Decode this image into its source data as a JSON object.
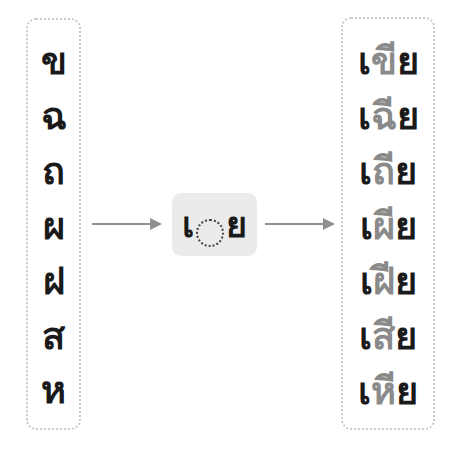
{
  "diagram": {
    "input_consonants": [
      "ข",
      "ฉ",
      "ถ",
      "ผ",
      "ฝ",
      "ส",
      "ห"
    ],
    "pattern": {
      "prefix": "เ",
      "placeholder": "◌",
      "upper_vowel": "ี",
      "suffix": "ย",
      "full": "เ◌ีย"
    },
    "outputs": [
      {
        "pre": "เ",
        "cons": "ขี",
        "post": "ย",
        "full": "เขีย"
      },
      {
        "pre": "เ",
        "cons": "ฉี",
        "post": "ย",
        "full": "เฉีย"
      },
      {
        "pre": "เ",
        "cons": "ถี",
        "post": "ย",
        "full": "เถีย"
      },
      {
        "pre": "เ",
        "cons": "ผี",
        "post": "ย",
        "full": "เผีย"
      },
      {
        "pre": "เ",
        "cons": "ฝี",
        "post": "ย",
        "full": "เฝีย"
      },
      {
        "pre": "เ",
        "cons": "สี",
        "post": "ย",
        "full": "เสีย"
      },
      {
        "pre": "เ",
        "cons": "หี",
        "post": "ย",
        "full": "เหีย"
      }
    ],
    "colors": {
      "text": "#1a1a1a",
      "highlight_consonant": "#8a8a8a",
      "arrow": "#909090",
      "pattern_bg": "#ebebeb",
      "box_border": "#c8c8c8"
    }
  }
}
